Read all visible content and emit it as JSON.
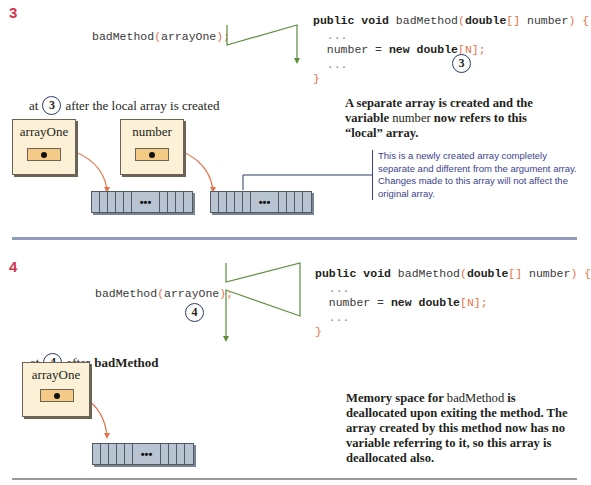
{
  "colors": {
    "step_number": "#d2344f",
    "flow_arrow": "#5c8c3c",
    "pointer_arrow": "#e5734a",
    "variable_box": "#fcf1d6",
    "reference_slot": "#f5c986",
    "array_fill": "#b8c4d2",
    "annotation_text": "#3d3f8c",
    "divider_blue": "#8f9bb8"
  },
  "step3": {
    "number": "3",
    "call": {
      "method": "badMethod",
      "open": "(",
      "arg": "arrayOne",
      "close": ");"
    },
    "method_code": {
      "sig_public": "public",
      "sig_void": "void",
      "sig_name": "badMethod",
      "sig_open": "(",
      "sig_type": "double",
      "sig_brackets": "[]",
      "sig_param": "number",
      "sig_close": ")",
      "sig_brace": "{",
      "line_dots1": "...",
      "assign_lhs": "number = ",
      "assign_new": "new",
      "assign_type": "double",
      "assign_idx": "[N]",
      "assign_semi": ";",
      "line_dots2": "...",
      "close_brace": "}"
    },
    "marker": "3",
    "caption": {
      "prefix": "at",
      "marker": "3",
      "text": "after the local array is created"
    },
    "variables": [
      {
        "name": "arrayOne"
      },
      {
        "name": "number"
      }
    ],
    "array_ellipsis": "•••",
    "note": {
      "part1": "A separate array is created and the variable ",
      "code": "number",
      "part2": " now refers to this “local” array."
    },
    "annotation": "This is a newly created array completely separate and different from the argument array. Changes made to this array will not affect the original array."
  },
  "step4": {
    "number": "4",
    "call": {
      "method": "badMethod",
      "open": "(",
      "arg": "arrayOne",
      "close": ");"
    },
    "marker": "4",
    "method_code": {
      "sig_public": "public",
      "sig_void": "void",
      "sig_name": "badMethod",
      "sig_open": "(",
      "sig_type": "double",
      "sig_brackets": "[]",
      "sig_param": "number",
      "sig_close": ")",
      "sig_brace": "{",
      "line_dots1": "...",
      "assign_lhs": "number = ",
      "assign_new": "new",
      "assign_type": "double",
      "assign_idx": "[N]",
      "assign_semi": ";",
      "line_dots2": "...",
      "close_brace": "}"
    },
    "caption": {
      "prefix": "at",
      "marker": "4",
      "text": "after",
      "bold": "badMethod"
    },
    "variables": [
      {
        "name": "arrayOne"
      }
    ],
    "array_ellipsis": "•••",
    "note": {
      "part1": "Memory space for ",
      "code": "badMethod",
      "part2": " is deallocated upon exiting the method. The array created by this method now has no variable referring to it, so this array is deallocated also."
    }
  }
}
